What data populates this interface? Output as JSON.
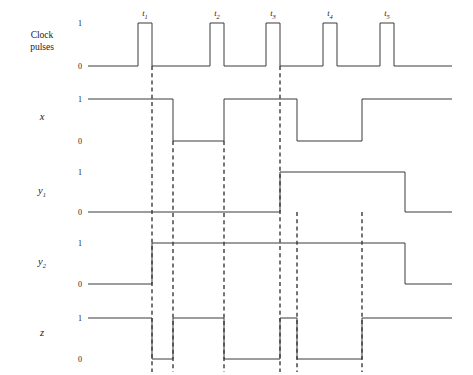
{
  "figure": {
    "background_color": "#ffffff",
    "line_color": "#3a3a3a",
    "width": 473,
    "height": 375
  },
  "chart_data": {
    "type": "line",
    "xlabel": "",
    "ylabel": "",
    "grid": false,
    "legend": false,
    "time_axis": {
      "x_start": 88,
      "x_end": 452,
      "tick_names": [
        "t1",
        "t2",
        "t3",
        "t4",
        "t5"
      ],
      "tick_labels": [
        "t",
        "t",
        "t",
        "t",
        "t"
      ],
      "tick_subscripts": [
        "1",
        "2",
        "3",
        "4",
        "5"
      ],
      "tick_x": [
        152,
        224,
        280,
        337,
        394
      ],
      "marker_x": [
        152,
        173,
        224,
        280,
        297,
        362
      ]
    },
    "levels": [
      "1",
      "0"
    ],
    "signals": [
      {
        "name": "clock-pulses",
        "label_lines": [
          "Clock",
          "pulses"
        ],
        "label_italic": false,
        "label_x": 42,
        "label_y": 38,
        "y_high": 23,
        "y_low": 66,
        "level_label_x": 80,
        "initial": 0,
        "transitions": [
          {
            "x": 138,
            "to": 1
          },
          {
            "x": 152,
            "to": 0
          },
          {
            "x": 210,
            "to": 1
          },
          {
            "x": 224,
            "to": 0
          },
          {
            "x": 266,
            "to": 1
          },
          {
            "x": 280,
            "to": 0
          },
          {
            "x": 323,
            "to": 1
          },
          {
            "x": 337,
            "to": 0
          },
          {
            "x": 380,
            "to": 1
          },
          {
            "x": 394,
            "to": 0
          }
        ]
      },
      {
        "name": "x",
        "label_lines": [
          "x"
        ],
        "label_italic": true,
        "label_x": 42,
        "label_y": 120,
        "y_high": 99,
        "y_low": 141,
        "level_label_x": 80,
        "initial": 1,
        "transitions": [
          {
            "x": 173,
            "to": 0
          },
          {
            "x": 224,
            "to": 1
          },
          {
            "x": 297,
            "to": 0
          },
          {
            "x": 362,
            "to": 1
          }
        ]
      },
      {
        "name": "y1",
        "label_lines": [
          "y"
        ],
        "label_subscript": "1",
        "label_italic": true,
        "label_x": 42,
        "label_y": 194,
        "y_high": 172,
        "y_low": 212,
        "level_label_x": 80,
        "initial": 0,
        "transitions": [
          {
            "x": 280,
            "to": 1
          },
          {
            "x": 405,
            "to": 0
          }
        ]
      },
      {
        "name": "y2",
        "label_lines": [
          "y"
        ],
        "label_subscript": "2",
        "label_italic": true,
        "label_x": 42,
        "label_y": 265,
        "y_high": 243,
        "y_low": 284,
        "level_label_x": 80,
        "initial": 0,
        "transitions": [
          {
            "x": 152,
            "to": 1
          },
          {
            "x": 405,
            "to": 0
          }
        ]
      },
      {
        "name": "z",
        "label_lines": [
          "z"
        ],
        "label_italic": true,
        "label_x": 42,
        "label_y": 336,
        "y_high": 318,
        "y_low": 359,
        "level_label_x": 80,
        "initial": 1,
        "transitions": [
          {
            "x": 152,
            "to": 0
          },
          {
            "x": 173,
            "to": 1
          },
          {
            "x": 224,
            "to": 0
          },
          {
            "x": 280,
            "to": 1
          },
          {
            "x": 297,
            "to": 0
          },
          {
            "x": 362,
            "to": 1
          }
        ]
      }
    ],
    "markers": [
      {
        "x": 152,
        "y_top": 66,
        "y_bottom": 372
      },
      {
        "x": 173,
        "y_top": 141,
        "y_bottom": 372
      },
      {
        "x": 224,
        "y_top": 141,
        "y_bottom": 372
      },
      {
        "x": 280,
        "y_top": 66,
        "y_bottom": 372
      },
      {
        "x": 297,
        "y_top": 212,
        "y_bottom": 372
      },
      {
        "x": 362,
        "y_top": 212,
        "y_bottom": 372
      }
    ]
  }
}
